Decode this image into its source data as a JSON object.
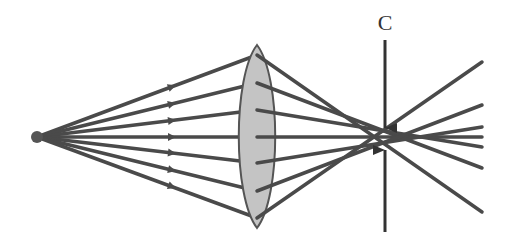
{
  "diagram": {
    "label": "C",
    "colors": {
      "ray": "#4a4a4a",
      "lens_fill": "#c4c4c4",
      "lens_stroke": "#555555",
      "arrow": "#333333",
      "source": "#555555"
    },
    "source": {
      "x": 37,
      "y": 137
    },
    "lens": {
      "x": 257,
      "top": 45,
      "bottom": 228,
      "half_width": 18
    },
    "focus": {
      "x": 385,
      "y": 138
    },
    "rays": [
      {
        "lens_y": 55,
        "end_y": 212
      },
      {
        "lens_y": 83,
        "end_y": 168
      },
      {
        "lens_y": 110,
        "end_y": 147
      },
      {
        "lens_y": 137,
        "end_y": 137
      },
      {
        "lens_y": 163,
        "end_y": 127
      },
      {
        "lens_y": 191,
        "end_y": 105
      },
      {
        "lens_y": 218,
        "end_y": 62
      }
    ],
    "marker": {
      "x": 385,
      "top_start": 40,
      "top_end": 128,
      "bottom_start": 232,
      "bottom_end": 150
    }
  }
}
